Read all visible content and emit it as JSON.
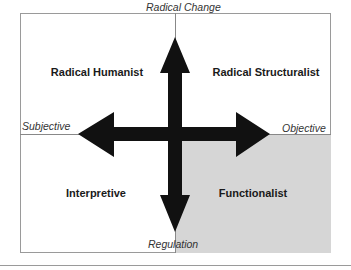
{
  "diagram": {
    "axes": {
      "top": "Radical Change",
      "bottom": "Regulation",
      "left": "Subjective",
      "right": "Objective"
    },
    "quadrants": {
      "top_left": "Radical Humanist",
      "top_right": "Radical Structuralist",
      "bottom_left": "Interpretive",
      "bottom_right": "Functionalist"
    },
    "colors": {
      "arrow": "#111111",
      "shaded_quadrant": "#d6d6d6",
      "border": "#9a9a9a"
    }
  }
}
